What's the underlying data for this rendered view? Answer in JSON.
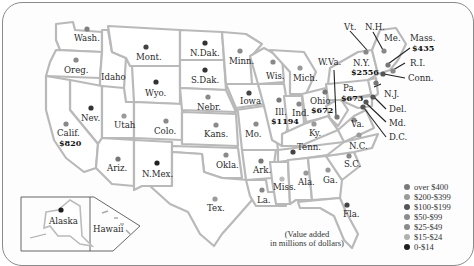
{
  "map": {
    "title": "Value added by state",
    "note_line1": "(Value added",
    "note_line2": "in millions of dollars)",
    "inset_labels": {
      "alaska": "Alaska",
      "hawaii": "Hawaii"
    }
  },
  "legend": {
    "items": [
      {
        "label": "over $400",
        "color": "#7a7a7a"
      },
      {
        "label": "$200-$399",
        "color": "#9a9a9a"
      },
      {
        "label": "$100-$199",
        "color": "#555555"
      },
      {
        "label": "$50-$99",
        "color": "#8c8c8c"
      },
      {
        "label": "$25-$49",
        "color": "#8a8a8a"
      },
      {
        "label": "$15-$24",
        "color": "#b0b0b0"
      },
      {
        "label": "0-$14",
        "color": "#1e1e1e"
      }
    ]
  },
  "states": [
    {
      "name": "Wash.",
      "value": ""
    },
    {
      "name": "Oreg.",
      "value": ""
    },
    {
      "name": "Idaho",
      "value": ""
    },
    {
      "name": "Mont.",
      "value": ""
    },
    {
      "name": "Wyo.",
      "value": ""
    },
    {
      "name": "Nev.",
      "value": ""
    },
    {
      "name": "Utah",
      "value": ""
    },
    {
      "name": "Calif.",
      "value": "$820"
    },
    {
      "name": "Colo.",
      "value": ""
    },
    {
      "name": "Ariz.",
      "value": ""
    },
    {
      "name": "N.Mex.",
      "value": ""
    },
    {
      "name": "N.Dak.",
      "value": ""
    },
    {
      "name": "S.Dak.",
      "value": ""
    },
    {
      "name": "Nebr.",
      "value": ""
    },
    {
      "name": "Kans.",
      "value": ""
    },
    {
      "name": "Okla.",
      "value": ""
    },
    {
      "name": "Tex.",
      "value": ""
    },
    {
      "name": "Minn.",
      "value": ""
    },
    {
      "name": "Iowa",
      "value": ""
    },
    {
      "name": "Mo.",
      "value": ""
    },
    {
      "name": "Ark.",
      "value": ""
    },
    {
      "name": "La.",
      "value": ""
    },
    {
      "name": "Wis.",
      "value": ""
    },
    {
      "name": "Ill.",
      "value": "$1194"
    },
    {
      "name": "Mich.",
      "value": ""
    },
    {
      "name": "Ind.",
      "value": ""
    },
    {
      "name": "Ohio",
      "value": "$672"
    },
    {
      "name": "Ky.",
      "value": ""
    },
    {
      "name": "Tenn.",
      "value": ""
    },
    {
      "name": "Miss.",
      "value": ""
    },
    {
      "name": "Ala.",
      "value": ""
    },
    {
      "name": "Ga.",
      "value": ""
    },
    {
      "name": "Fla.",
      "value": ""
    },
    {
      "name": "S.C.",
      "value": ""
    },
    {
      "name": "N.C.",
      "value": ""
    },
    {
      "name": "Va.",
      "value": ""
    },
    {
      "name": "W.Va.",
      "value": ""
    },
    {
      "name": "Pa.",
      "value": "$673"
    },
    {
      "name": "N.Y.",
      "value": "$2556"
    },
    {
      "name": "Vt.",
      "value": ""
    },
    {
      "name": "N.H.",
      "value": ""
    },
    {
      "name": "Me.",
      "value": ""
    },
    {
      "name": "Mass.",
      "value": "$435"
    },
    {
      "name": "R.I.",
      "value": ""
    },
    {
      "name": "Conn.",
      "value": ""
    },
    {
      "name": "N.J.",
      "value": ""
    },
    {
      "name": "Del.",
      "value": ""
    },
    {
      "name": "Md.",
      "value": ""
    },
    {
      "name": "D.C.",
      "value": ""
    }
  ]
}
